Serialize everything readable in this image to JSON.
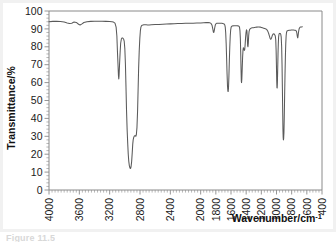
{
  "figure": {
    "caption": "Figure 11.5",
    "background": "#ffffff",
    "frame_color": "#f1f1f1"
  },
  "chart_data": {
    "type": "line",
    "title": "",
    "subtitle": "",
    "xlabel": "Wavenumber/cm",
    "xlabel_superscript": "-1",
    "ylabel": "Transmittance/%",
    "xlim": [
      4000,
      400
    ],
    "ylim": [
      0,
      100
    ],
    "x_inverted": true,
    "grid": false,
    "legend": null,
    "trace_color": "#5a5a5a",
    "axis_color": "#8a8a8a",
    "xticks": [
      4000,
      3800,
      3600,
      3400,
      3200,
      3000,
      2800,
      2600,
      2400,
      2200,
      2000,
      1800,
      1600,
      1400,
      1200,
      1000,
      800,
      600,
      400
    ],
    "xtick_labels": [
      "4000",
      "3600",
      "3200",
      "2800",
      "2400",
      "2000",
      "1800",
      "1600",
      "1400",
      "1200",
      "1000",
      "800",
      "600",
      "400"
    ],
    "xtick_label_values": [
      4000,
      3600,
      3200,
      2800,
      2400,
      2000,
      1800,
      1600,
      1400,
      1200,
      1000,
      800,
      600,
      400
    ],
    "xtick_minor_step": 40,
    "yticks": [
      0,
      10,
      20,
      30,
      40,
      50,
      60,
      70,
      80,
      90,
      100
    ],
    "ytick_labels": [
      "0",
      "10",
      "20",
      "30",
      "40",
      "50",
      "60",
      "70",
      "80",
      "90",
      "100"
    ],
    "ytick_minor_step": 2,
    "trace_start_wavenumber": 4000,
    "trace_end_wavenumber": 660,
    "baseline_transmittance": 94,
    "peaks": [
      {
        "wavenumber": 3700,
        "transmittance": 93,
        "label": "weak baseline wobble"
      },
      {
        "wavenumber": 3590,
        "transmittance": 92,
        "label": "weak baseline wobble"
      },
      {
        "wavenumber": 3080,
        "transmittance": 62,
        "label": "=C-H stretch"
      },
      {
        "wavenumber": 3010,
        "transmittance": 84,
        "label": "shoulder"
      },
      {
        "wavenumber": 2925,
        "transmittance": 12,
        "label": "C-H stretch (strong)"
      },
      {
        "wavenumber": 2855,
        "transmittance": 30,
        "label": "C-H stretch"
      },
      {
        "wavenumber": 1830,
        "transmittance": 88,
        "label": "weak overtone"
      },
      {
        "wavenumber": 1640,
        "transmittance": 55,
        "label": "C=C stretch"
      },
      {
        "wavenumber": 1465,
        "transmittance": 60,
        "label": "CH2 bend"
      },
      {
        "wavenumber": 1420,
        "transmittance": 78,
        "label": "CH bend"
      },
      {
        "wavenumber": 1378,
        "transmittance": 80,
        "label": "CH3 bend"
      },
      {
        "wavenumber": 1075,
        "transmittance": 84,
        "label": "medium"
      },
      {
        "wavenumber": 995,
        "transmittance": 57,
        "label": "=CH out-of-plane bend"
      },
      {
        "wavenumber": 910,
        "transmittance": 28,
        "label": "=CH2 out-of-plane bend (strong)"
      },
      {
        "wavenumber": 722,
        "transmittance": 85,
        "label": "CH2 rock"
      }
    ],
    "points": [
      [
        4000,
        94.0
      ],
      [
        3950,
        94.2
      ],
      [
        3900,
        94.3
      ],
      [
        3850,
        94.1
      ],
      [
        3800,
        93.8
      ],
      [
        3760,
        93.3
      ],
      [
        3730,
        93.0
      ],
      [
        3700,
        93.2
      ],
      [
        3670,
        93.8
      ],
      [
        3640,
        93.6
      ],
      [
        3610,
        92.6
      ],
      [
        3590,
        92.2
      ],
      [
        3565,
        92.8
      ],
      [
        3540,
        93.6
      ],
      [
        3500,
        94.0
      ],
      [
        3450,
        94.2
      ],
      [
        3400,
        94.3
      ],
      [
        3350,
        94.3
      ],
      [
        3300,
        94.3
      ],
      [
        3250,
        94.2
      ],
      [
        3200,
        94.1
      ],
      [
        3170,
        94.0
      ],
      [
        3150,
        93.8
      ],
      [
        3130,
        93.2
      ],
      [
        3115,
        91.0
      ],
      [
        3105,
        86.0
      ],
      [
        3098,
        78.0
      ],
      [
        3090,
        70.0
      ],
      [
        3084,
        64.0
      ],
      [
        3080,
        62.0
      ],
      [
        3076,
        64.0
      ],
      [
        3070,
        70.0
      ],
      [
        3062,
        77.0
      ],
      [
        3055,
        82.0
      ],
      [
        3045,
        84.5
      ],
      [
        3035,
        85.0
      ],
      [
        3025,
        84.8
      ],
      [
        3015,
        84.2
      ],
      [
        3008,
        83.0
      ],
      [
        3000,
        79.0
      ],
      [
        2992,
        70.0
      ],
      [
        2985,
        58.0
      ],
      [
        2978,
        45.0
      ],
      [
        2970,
        34.0
      ],
      [
        2962,
        26.0
      ],
      [
        2955,
        20.0
      ],
      [
        2948,
        16.0
      ],
      [
        2940,
        13.5
      ],
      [
        2932,
        12.2
      ],
      [
        2925,
        12.0
      ],
      [
        2918,
        13.0
      ],
      [
        2910,
        16.0
      ],
      [
        2902,
        21.0
      ],
      [
        2896,
        25.5
      ],
      [
        2890,
        28.0
      ],
      [
        2882,
        29.5
      ],
      [
        2874,
        30.2
      ],
      [
        2866,
        30.4
      ],
      [
        2860,
        30.2
      ],
      [
        2855,
        30.0
      ],
      [
        2848,
        31.0
      ],
      [
        2840,
        35.0
      ],
      [
        2832,
        44.0
      ],
      [
        2825,
        56.0
      ],
      [
        2818,
        68.0
      ],
      [
        2810,
        78.0
      ],
      [
        2802,
        85.0
      ],
      [
        2795,
        89.0
      ],
      [
        2788,
        91.0
      ],
      [
        2780,
        91.8
      ],
      [
        2770,
        92.1
      ],
      [
        2750,
        92.3
      ],
      [
        2720,
        92.3
      ],
      [
        2700,
        92.2
      ],
      [
        2680,
        92.2
      ],
      [
        2650,
        92.3
      ],
      [
        2600,
        92.4
      ],
      [
        2550,
        92.5
      ],
      [
        2500,
        92.6
      ],
      [
        2450,
        92.7
      ],
      [
        2400,
        92.8
      ],
      [
        2350,
        92.9
      ],
      [
        2300,
        93.0
      ],
      [
        2250,
        93.0
      ],
      [
        2200,
        93.1
      ],
      [
        2150,
        93.2
      ],
      [
        2100,
        93.2
      ],
      [
        2050,
        93.3
      ],
      [
        2000,
        93.3
      ],
      [
        1960,
        93.4
      ],
      [
        1930,
        93.5
      ],
      [
        1900,
        93.5
      ],
      [
        1880,
        93.4
      ],
      [
        1865,
        93.1
      ],
      [
        1850,
        92.0
      ],
      [
        1840,
        90.0
      ],
      [
        1833,
        88.3
      ],
      [
        1828,
        88.0
      ],
      [
        1822,
        88.8
      ],
      [
        1815,
        90.5
      ],
      [
        1808,
        92.0
      ],
      [
        1800,
        92.8
      ],
      [
        1790,
        93.1
      ],
      [
        1780,
        93.2
      ],
      [
        1760,
        93.2
      ],
      [
        1740,
        93.2
      ],
      [
        1720,
        93.1
      ],
      [
        1710,
        93.0
      ],
      [
        1700,
        92.9
      ],
      [
        1690,
        92.7
      ],
      [
        1682,
        92.2
      ],
      [
        1676,
        91.0
      ],
      [
        1670,
        88.0
      ],
      [
        1664,
        82.0
      ],
      [
        1658,
        74.0
      ],
      [
        1652,
        65.0
      ],
      [
        1646,
        58.0
      ],
      [
        1641,
        55.2
      ],
      [
        1637,
        55.0
      ],
      [
        1633,
        57.0
      ],
      [
        1628,
        63.0
      ],
      [
        1622,
        72.0
      ],
      [
        1616,
        80.0
      ],
      [
        1610,
        86.0
      ],
      [
        1604,
        89.5
      ],
      [
        1598,
        91.0
      ],
      [
        1590,
        91.5
      ],
      [
        1580,
        91.7
      ],
      [
        1560,
        91.8
      ],
      [
        1540,
        91.8
      ],
      [
        1520,
        91.8
      ],
      [
        1505,
        91.7
      ],
      [
        1495,
        91.5
      ],
      [
        1488,
        91.0
      ],
      [
        1482,
        89.0
      ],
      [
        1477,
        85.0
      ],
      [
        1472,
        77.0
      ],
      [
        1468,
        68.0
      ],
      [
        1464,
        61.0
      ],
      [
        1461,
        60.0
      ],
      [
        1457,
        62.0
      ],
      [
        1452,
        68.0
      ],
      [
        1447,
        74.0
      ],
      [
        1442,
        78.0
      ],
      [
        1437,
        79.5
      ],
      [
        1432,
        79.0
      ],
      [
        1428,
        78.3
      ],
      [
        1424,
        78.0
      ],
      [
        1419,
        78.5
      ],
      [
        1414,
        81.0
      ],
      [
        1408,
        85.0
      ],
      [
        1402,
        88.0
      ],
      [
        1396,
        89.5
      ],
      [
        1390,
        89.0
      ],
      [
        1385,
        85.0
      ],
      [
        1380,
        80.5
      ],
      [
        1376,
        80.0
      ],
      [
        1372,
        82.0
      ],
      [
        1367,
        86.0
      ],
      [
        1362,
        88.5
      ],
      [
        1356,
        89.5
      ],
      [
        1348,
        90.0
      ],
      [
        1340,
        90.3
      ],
      [
        1330,
        90.5
      ],
      [
        1320,
        90.6
      ],
      [
        1305,
        90.7
      ],
      [
        1290,
        90.8
      ],
      [
        1275,
        90.9
      ],
      [
        1260,
        91.0
      ],
      [
        1245,
        91.1
      ],
      [
        1230,
        91.1
      ],
      [
        1215,
        91.0
      ],
      [
        1200,
        90.8
      ],
      [
        1185,
        90.6
      ],
      [
        1170,
        90.4
      ],
      [
        1155,
        90.2
      ],
      [
        1140,
        90.0
      ],
      [
        1128,
        89.6
      ],
      [
        1118,
        89.0
      ],
      [
        1110,
        88.2
      ],
      [
        1100,
        87.0
      ],
      [
        1092,
        85.8
      ],
      [
        1085,
        84.8
      ],
      [
        1078,
        84.2
      ],
      [
        1072,
        84.3
      ],
      [
        1065,
        85.0
      ],
      [
        1058,
        86.0
      ],
      [
        1050,
        86.8
      ],
      [
        1042,
        87.2
      ],
      [
        1035,
        87.3
      ],
      [
        1028,
        87.0
      ],
      [
        1022,
        86.6
      ],
      [
        1016,
        86.0
      ],
      [
        1010,
        84.0
      ],
      [
        1005,
        78.0
      ],
      [
        1001,
        70.0
      ],
      [
        997,
        61.0
      ],
      [
        994,
        57.2
      ],
      [
        991,
        57.0
      ],
      [
        988,
        60.0
      ],
      [
        984,
        68.0
      ],
      [
        980,
        76.0
      ],
      [
        976,
        82.0
      ],
      [
        972,
        85.5
      ],
      [
        967,
        87.0
      ],
      [
        962,
        87.4
      ],
      [
        956,
        87.5
      ],
      [
        950,
        87.4
      ],
      [
        944,
        87.0
      ],
      [
        938,
        85.5
      ],
      [
        932,
        80.0
      ],
      [
        927,
        70.0
      ],
      [
        922,
        56.0
      ],
      [
        918,
        43.0
      ],
      [
        915,
        34.0
      ],
      [
        912,
        29.5
      ],
      [
        909,
        28.0
      ],
      [
        906,
        28.5
      ],
      [
        902,
        32.0
      ],
      [
        898,
        40.0
      ],
      [
        893,
        52.0
      ],
      [
        888,
        64.0
      ],
      [
        883,
        74.0
      ],
      [
        878,
        81.5
      ],
      [
        873,
        86.0
      ],
      [
        868,
        88.0
      ],
      [
        862,
        88.8
      ],
      [
        855,
        89.0
      ],
      [
        845,
        89.1
      ],
      [
        835,
        89.2
      ],
      [
        820,
        89.3
      ],
      [
        805,
        89.4
      ],
      [
        790,
        89.4
      ],
      [
        775,
        89.4
      ],
      [
        762,
        89.3
      ],
      [
        750,
        89.2
      ],
      [
        742,
        89.0
      ],
      [
        736,
        88.5
      ],
      [
        731,
        87.5
      ],
      [
        727,
        86.2
      ],
      [
        723,
        85.2
      ],
      [
        720,
        85.0
      ],
      [
        717,
        85.6
      ],
      [
        713,
        87.0
      ],
      [
        708,
        88.6
      ],
      [
        703,
        89.8
      ],
      [
        697,
        90.5
      ],
      [
        690,
        90.9
      ],
      [
        683,
        91.0
      ],
      [
        675,
        91.1
      ],
      [
        668,
        91.1
      ],
      [
        660,
        91.2
      ]
    ]
  }
}
